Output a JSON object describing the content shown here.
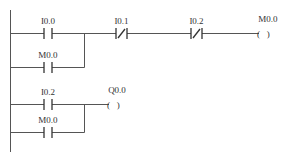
{
  "diagram": {
    "type": "ladder-logic",
    "colors": {
      "line": "#555555",
      "text": "#333333",
      "background": "#ffffff"
    },
    "rungs": [
      {
        "id": "rung-1",
        "elements": [
          {
            "type": "contact-no",
            "label": "I0.0"
          },
          {
            "type": "contact-no",
            "label": "M0.0",
            "parallel_branch": true
          },
          {
            "type": "contact-nc",
            "label": "I0.1"
          },
          {
            "type": "contact-nc",
            "label": "I0.2"
          },
          {
            "type": "coil",
            "label": "M0.0",
            "glyph": "(   )"
          }
        ]
      },
      {
        "id": "rung-2",
        "elements": [
          {
            "type": "contact-no",
            "label": "I0.2"
          },
          {
            "type": "contact-no",
            "label": "M0.0",
            "parallel_branch": true
          },
          {
            "type": "coil",
            "label": "Q0.0",
            "glyph": "(   )"
          }
        ]
      }
    ]
  }
}
